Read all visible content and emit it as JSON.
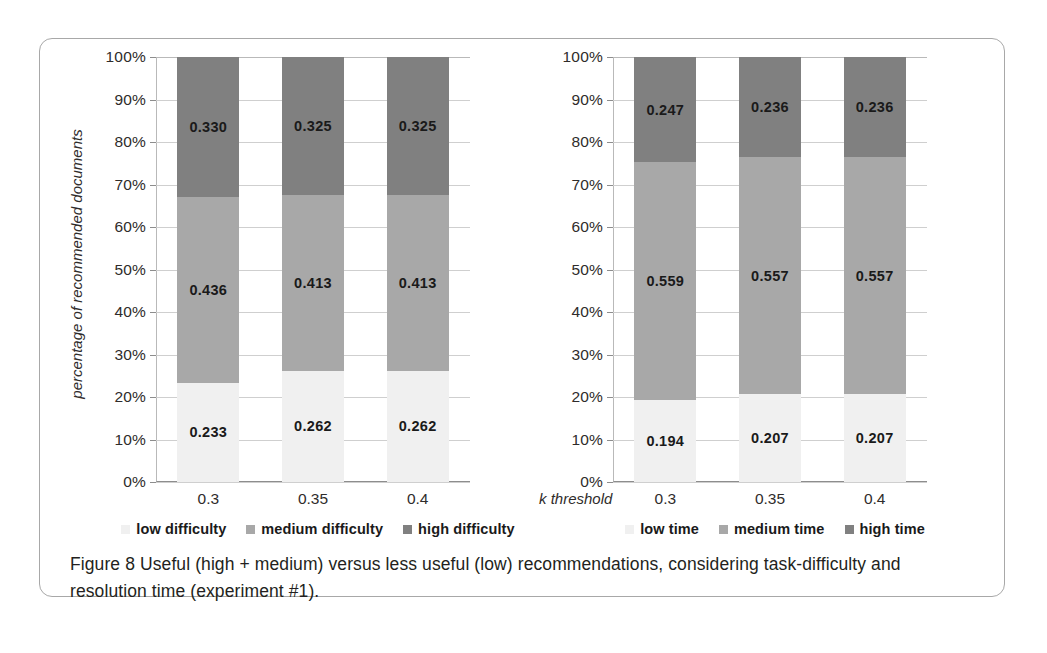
{
  "figure": {
    "caption_line1": "Figure 8 Useful (high + medium) versus less useful (low) recommendations, considering",
    "caption_line2": "task-difficulty and resolution time (experiment #1)."
  },
  "colors": {
    "low": "#f0f0f0",
    "medium": "#a8a8a8",
    "high": "#808080",
    "axis": "#8d8d8d",
    "grid": "#cfcfcf",
    "text": "#231f20",
    "frame": "#a8a8a8"
  },
  "chart_data": [
    {
      "type": "bar",
      "id": "task-difficulty",
      "stacked": true,
      "stacked_normalized": true,
      "title": "",
      "xlabel": "",
      "ylabel": "percentage of recommended documents",
      "categories": [
        "0.3",
        "0.35",
        "0.4"
      ],
      "ytick_labels": [
        "0%",
        "10%",
        "20%",
        "30%",
        "40%",
        "50%",
        "60%",
        "70%",
        "80%",
        "90%",
        "100%"
      ],
      "ytick_values": [
        0,
        10,
        20,
        30,
        40,
        50,
        60,
        70,
        80,
        90,
        100
      ],
      "ylim": [
        0,
        100
      ],
      "grid": true,
      "legend_position": "bottom",
      "series": [
        {
          "name": "low difficulty",
          "key": "low",
          "values": [
            0.233,
            0.262,
            0.262
          ],
          "labels": [
            "0.233",
            "0.262",
            "0.262"
          ]
        },
        {
          "name": "medium difficulty",
          "key": "medium",
          "values": [
            0.436,
            0.413,
            0.413
          ],
          "labels": [
            "0.436",
            "0.413",
            "0.413"
          ]
        },
        {
          "name": "high difficulty",
          "key": "high",
          "values": [
            0.33,
            0.325,
            0.325
          ],
          "labels": [
            "0.330",
            "0.325",
            "0.325"
          ]
        }
      ]
    },
    {
      "type": "bar",
      "id": "resolution-time",
      "stacked": true,
      "stacked_normalized": true,
      "title": "",
      "xlabel": "k threshold",
      "ylabel": "",
      "categories": [
        "0.3",
        "0.35",
        "0.4"
      ],
      "ytick_labels": [
        "0%",
        "10%",
        "20%",
        "30%",
        "40%",
        "50%",
        "60%",
        "70%",
        "80%",
        "90%",
        "100%"
      ],
      "ytick_values": [
        0,
        10,
        20,
        30,
        40,
        50,
        60,
        70,
        80,
        90,
        100
      ],
      "ylim": [
        0,
        100
      ],
      "grid": true,
      "legend_position": "bottom",
      "series": [
        {
          "name": "low time",
          "key": "low",
          "values": [
            0.194,
            0.207,
            0.207
          ],
          "labels": [
            "0.194",
            "0.207",
            "0.207"
          ]
        },
        {
          "name": "medium time",
          "key": "medium",
          "values": [
            0.559,
            0.557,
            0.557
          ],
          "labels": [
            "0.559",
            "0.557",
            "0.557"
          ]
        },
        {
          "name": "high time",
          "key": "high",
          "values": [
            0.247,
            0.236,
            0.236
          ],
          "labels": [
            "0.247",
            "0.236",
            "0.236"
          ]
        }
      ]
    }
  ]
}
